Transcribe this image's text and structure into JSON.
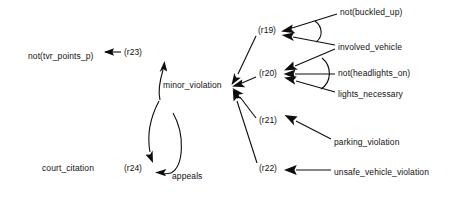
{
  "diagram": {
    "background_color": "#ffffff",
    "ink_color": "#0d0d0d",
    "nodes": [
      {
        "id": "not_tvr_points_p",
        "label": "not(tvr_points_p)",
        "x": 28,
        "y": 56
      },
      {
        "id": "minor_violation",
        "label": "minor_violation",
        "x": 163,
        "y": 85
      },
      {
        "id": "court_citation",
        "label": "court_citation",
        "x": 42,
        "y": 168
      },
      {
        "id": "appeals",
        "label": "appeals",
        "x": 172,
        "y": 176
      },
      {
        "id": "not_buckled_up",
        "label": "not(buckled_up)",
        "x": 340,
        "y": 12
      },
      {
        "id": "involved_vehicle",
        "label": "involved_vehicle",
        "x": 338,
        "y": 47
      },
      {
        "id": "not_headlights_on",
        "label": "not(headlights_on)",
        "x": 338,
        "y": 73
      },
      {
        "id": "lights_necessary",
        "label": "lights_necessary",
        "x": 338,
        "y": 94
      },
      {
        "id": "parking_violation",
        "label": "parking_violation",
        "x": 334,
        "y": 142
      },
      {
        "id": "unsafe_vehicle_violation",
        "label": "unsafe_vehicle_violation",
        "x": 334,
        "y": 172
      }
    ],
    "rules": [
      {
        "id": "r19",
        "label": "(r19)",
        "x": 258,
        "y": 30
      },
      {
        "id": "r20",
        "label": "(r20)",
        "x": 259,
        "y": 73
      },
      {
        "id": "r21",
        "label": "(r21)",
        "x": 259,
        "y": 120
      },
      {
        "id": "r22",
        "label": "(r22)",
        "x": 259,
        "y": 168
      },
      {
        "id": "r23",
        "label": "(r23)",
        "x": 124,
        "y": 56
      },
      {
        "id": "r24",
        "label": "(r24)",
        "x": 124,
        "y": 168
      }
    ],
    "edges": [
      {
        "from": "r23",
        "to": "not_tvr_points_p"
      },
      {
        "from": "minor_violation",
        "to": "r23"
      },
      {
        "from": "minor_violation",
        "to": "r24"
      },
      {
        "from": "r24",
        "to": "court_citation"
      },
      {
        "from": "appeals",
        "to": "r24"
      },
      {
        "from": "r19",
        "to": "minor_violation"
      },
      {
        "from": "r20",
        "to": "minor_violation"
      },
      {
        "from": "r21",
        "to": "minor_violation"
      },
      {
        "from": "r22",
        "to": "minor_violation"
      },
      {
        "from": "not_buckled_up",
        "to": "r19"
      },
      {
        "from": "involved_vehicle",
        "to": "r19"
      },
      {
        "from": "involved_vehicle",
        "to": "r20"
      },
      {
        "from": "not_headlights_on",
        "to": "r20"
      },
      {
        "from": "lights_necessary",
        "to": "r20"
      },
      {
        "from": "parking_violation",
        "to": "r21"
      },
      {
        "from": "unsafe_vehicle_violation",
        "to": "r22"
      }
    ],
    "conjunction_arcs": [
      {
        "rule": "r19",
        "spans": [
          "not_buckled_up",
          "involved_vehicle"
        ]
      },
      {
        "rule": "r20",
        "spans": [
          "involved_vehicle",
          "lights_necessary"
        ]
      }
    ]
  }
}
